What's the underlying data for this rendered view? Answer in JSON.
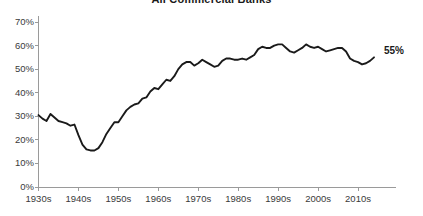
{
  "chart_data": {
    "type": "line",
    "title": "All Commercial Banks",
    "xlabel": "",
    "ylabel": "",
    "ylim": [
      0,
      70
    ],
    "xlim": [
      1930,
      2015
    ],
    "grid": false,
    "legend": null,
    "ytick_labels": [
      "70%",
      "60%",
      "50%",
      "40%",
      "30%",
      "20%",
      "10%",
      "0%"
    ],
    "ytick_values": [
      70,
      60,
      50,
      40,
      30,
      20,
      10,
      0
    ],
    "xtick_labels": [
      "1930s",
      "1940s",
      "1950s",
      "1960s",
      "1970s",
      "1980s",
      "1990s",
      "2000s",
      "2010s"
    ],
    "xtick_values": [
      1930,
      1940,
      1950,
      1960,
      1970,
      1980,
      1990,
      2000,
      2010
    ],
    "line_color": "#1a1a1a",
    "annotations": [
      {
        "text": "55%",
        "x": 2014,
        "y": 55
      }
    ],
    "series": [
      {
        "name": "All Commercial Banks",
        "x": [
          1930,
          1931,
          1932,
          1933,
          1934,
          1935,
          1936,
          1937,
          1938,
          1939,
          1940,
          1941,
          1942,
          1943,
          1944,
          1945,
          1946,
          1947,
          1948,
          1949,
          1950,
          1951,
          1952,
          1953,
          1954,
          1955,
          1956,
          1957,
          1958,
          1959,
          1960,
          1961,
          1962,
          1963,
          1964,
          1965,
          1966,
          1967,
          1968,
          1969,
          1970,
          1971,
          1972,
          1973,
          1974,
          1975,
          1976,
          1977,
          1978,
          1979,
          1980,
          1981,
          1982,
          1983,
          1984,
          1985,
          1986,
          1987,
          1988,
          1989,
          1990,
          1991,
          1992,
          1993,
          1994,
          1995,
          1996,
          1997,
          1998,
          1999,
          2000,
          2001,
          2002,
          2003,
          2004,
          2005,
          2006,
          2007,
          2008,
          2009,
          2010,
          2011,
          2012,
          2013,
          2014
        ],
        "values": [
          30.5,
          29.0,
          28.0,
          31.0,
          29.5,
          28.0,
          27.5,
          27.0,
          26.0,
          26.5,
          22.0,
          18.0,
          16.0,
          15.5,
          15.5,
          16.5,
          19.0,
          22.5,
          25.0,
          27.5,
          27.5,
          30.0,
          32.5,
          34.0,
          35.0,
          35.5,
          37.5,
          38.0,
          40.5,
          42.0,
          41.5,
          43.5,
          45.5,
          45.0,
          47.0,
          50.0,
          52.0,
          53.0,
          53.0,
          51.5,
          52.5,
          54.0,
          53.0,
          52.0,
          51.0,
          51.5,
          53.5,
          54.5,
          54.5,
          54.0,
          54.0,
          54.5,
          54.0,
          55.0,
          56.0,
          58.5,
          59.5,
          59.0,
          59.0,
          60.0,
          60.5,
          60.5,
          59.0,
          57.5,
          57.0,
          58.0,
          59.0,
          60.5,
          59.5,
          59.0,
          59.5,
          58.5,
          57.5,
          58.0,
          58.5,
          59.0,
          59.0,
          57.5,
          54.5,
          53.5,
          53.0,
          52.0,
          52.5,
          53.5,
          55.0
        ]
      }
    ]
  },
  "axis": {
    "axis_color": "#9a9a9a",
    "tick_color": "#9a9a9a"
  }
}
